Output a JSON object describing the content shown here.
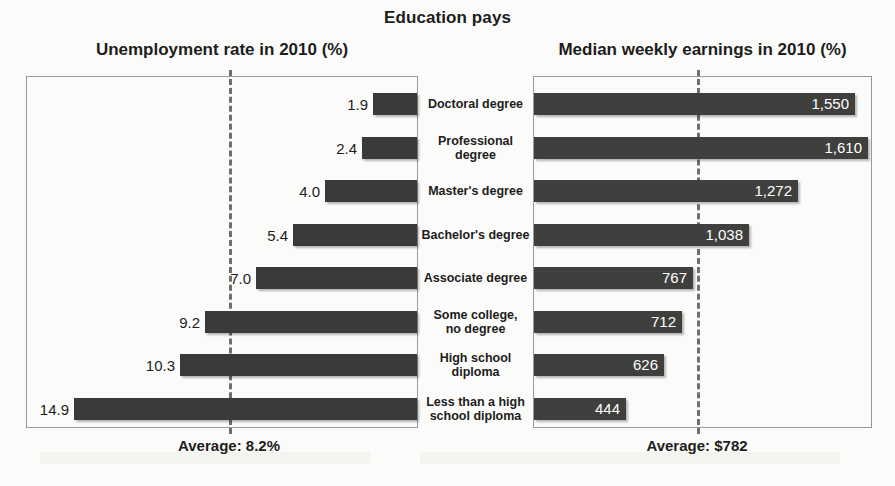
{
  "title": "Education pays",
  "left_panel": {
    "heading": "Unemployment rate in 2010 (%)",
    "average_label": "Average: 8.2%"
  },
  "right_panel": {
    "heading": "Median weekly earnings in 2010 (%)",
    "average_label": "Average: $782"
  },
  "chart_data": {
    "type": "bar",
    "title": "Education pays",
    "orientation": "horizontal-diverging",
    "categories": [
      "Doctoral degree",
      "Professional degree",
      "Master's degree",
      "Bachelor's degree",
      "Associate degree",
      "Some college,\nno degree",
      "High school\ndiploma",
      "Less than a high\nschool diploma"
    ],
    "series": [
      {
        "name": "Unemployment rate in 2010 (%)",
        "side": "left",
        "unit": "%",
        "values": [
          1.9,
          2.4,
          4.0,
          5.4,
          7.0,
          9.2,
          10.3,
          14.9
        ],
        "labels": [
          "1.9",
          "2.4",
          "4.0",
          "5.4",
          "7.0",
          "9.2",
          "10.3",
          "14.9"
        ],
        "axis_max": 17.0,
        "reference_line": {
          "value": 8.2,
          "label": "Average: 8.2%"
        }
      },
      {
        "name": "Median weekly earnings in 2010 (%)",
        "side": "right",
        "unit": "$",
        "values": [
          1550,
          1610,
          1272,
          1038,
          767,
          712,
          626,
          444
        ],
        "labels": [
          "1,550",
          "1,610",
          "1,272",
          "1,038",
          "767",
          "712",
          "626",
          "444"
        ],
        "axis_max": 1630,
        "reference_line": {
          "value": 782,
          "label": "Average: $782"
        }
      }
    ],
    "xlabel": "",
    "ylabel": "",
    "grid": false,
    "legend": "none"
  },
  "colors": {
    "bar": "#3a3a38",
    "panel_border": "#9a9a98",
    "reference_line": "#6f6f6e",
    "text": "#1d1d1b",
    "value_inside": "#ffffff",
    "background": "#fbfbfa"
  }
}
